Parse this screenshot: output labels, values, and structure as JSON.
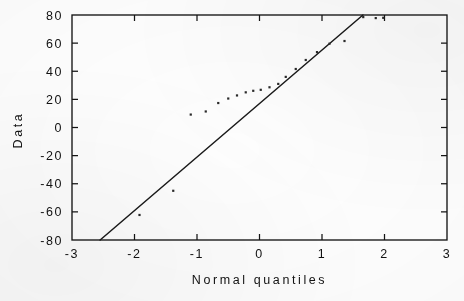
{
  "chart_data": {
    "type": "scatter",
    "title": "",
    "subtitle": "",
    "xlabel": "Normal quantiles",
    "ylabel": "Data",
    "xlim": [
      -3,
      3
    ],
    "ylim": [
      -80,
      80
    ],
    "xticks": [
      -3,
      -2,
      -1,
      0,
      1,
      2,
      3
    ],
    "xticklabels": [
      "-3",
      "-2",
      "-1",
      "0",
      "1",
      "2",
      "3"
    ],
    "yticks": [
      -80,
      -60,
      -40,
      -20,
      0,
      20,
      40,
      60,
      80
    ],
    "yticklabels": [
      "-80",
      "-60",
      "-40",
      "-20",
      "0",
      "20",
      "40",
      "60",
      "80"
    ],
    "grid": false,
    "legend": null,
    "tick_direction": "in",
    "frame": "full-box",
    "series": [
      {
        "name": "Sample quantiles",
        "type": "scatter",
        "marker": "dot",
        "color": "#2a2a2a",
        "points": [
          {
            "x": -1.92,
            "y": -62.2
          },
          {
            "x": -1.38,
            "y": -45.0
          },
          {
            "x": -1.1,
            "y": 9.2
          },
          {
            "x": -0.86,
            "y": 11.4
          },
          {
            "x": -0.66,
            "y": 17.4
          },
          {
            "x": -0.5,
            "y": 20.6
          },
          {
            "x": -0.36,
            "y": 22.8
          },
          {
            "x": -0.22,
            "y": 25.0
          },
          {
            "x": -0.1,
            "y": 26.1
          },
          {
            "x": 0.02,
            "y": 26.8
          },
          {
            "x": 0.16,
            "y": 28.6
          },
          {
            "x": 0.3,
            "y": 31.0
          },
          {
            "x": 0.42,
            "y": 36.0
          },
          {
            "x": 0.58,
            "y": 41.6
          },
          {
            "x": 0.74,
            "y": 48.0
          },
          {
            "x": 0.92,
            "y": 53.6
          },
          {
            "x": 1.12,
            "y": 59.6
          },
          {
            "x": 1.36,
            "y": 61.5
          },
          {
            "x": 1.66,
            "y": 78.5
          },
          {
            "x": 1.86,
            "y": 77.8
          },
          {
            "x": 1.98,
            "y": 78.0
          }
        ]
      },
      {
        "name": "Reference line",
        "type": "line",
        "color": "#1a1a1a",
        "slope": 38.0,
        "intercept": -16.9,
        "x_start": -2.55,
        "y_start": -80,
        "x_end": 1.655,
        "y_end": 80
      }
    ]
  },
  "figure": {
    "background_color": "#ffffff",
    "axis_color": "#141414",
    "appearance": "scanned-document"
  }
}
